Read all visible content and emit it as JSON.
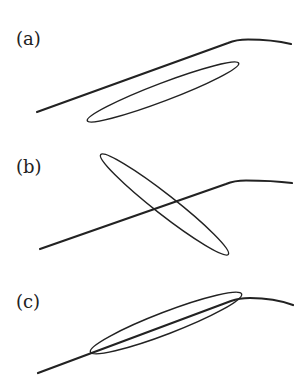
{
  "figure": {
    "panels": [
      {
        "label": "(a)",
        "description": "Ellipse lies below and parallel to the curve, not touching it",
        "label_pos": {
          "x": 16,
          "y": 30
        },
        "curve": {
          "start": [
            37,
            112
          ],
          "kink": [
            235,
            40
          ],
          "end": [
            291,
            44
          ]
        },
        "ellipse": {
          "cx": 163,
          "cy": 92,
          "rx": 81,
          "ry": 9,
          "angle": -20.8
        }
      },
      {
        "label": "(b)",
        "description": "Ellipse crosses the curve at a steep angle",
        "label_pos": {
          "x": 16,
          "y": 158
        },
        "curve": {
          "start": [
            40,
            249
          ],
          "kink": [
            233,
            181
          ],
          "end": [
            292,
            183
          ]
        },
        "ellipse": {
          "cx": 164.5,
          "cy": 204.5,
          "rx": 80,
          "ry": 10,
          "angle": 38
        }
      },
      {
        "label": "(c)",
        "description": "Ellipse is aligned with and tangent along the curve",
        "label_pos": {
          "x": 16,
          "y": 293
        },
        "curve": {
          "start": [
            38,
            373
          ],
          "kink": [
            238,
            299
          ],
          "end": [
            293,
            305
          ]
        },
        "ellipse": {
          "cx": 166,
          "cy": 323,
          "rx": 80,
          "ry": 11,
          "angle": -21
        }
      }
    ],
    "colors": {
      "stroke": "#222222",
      "label": "#222222",
      "background": "#ffffff"
    }
  }
}
